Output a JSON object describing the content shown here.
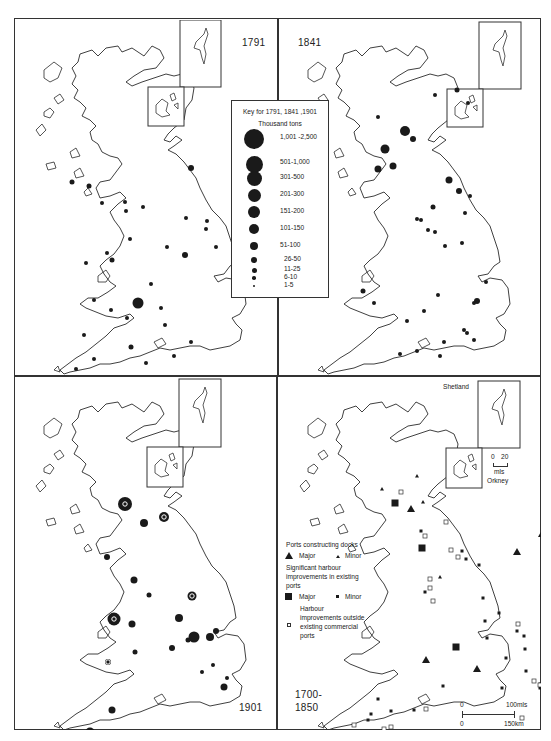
{
  "figure": {
    "panels": [
      {
        "id": "1791",
        "label": "1791",
        "position": "top-left"
      },
      {
        "id": "1841",
        "label": "1841",
        "position": "top-right"
      },
      {
        "id": "1901",
        "label": "1901",
        "position": "bottom-left"
      },
      {
        "id": "1700-1850",
        "label_line1": "1700-",
        "label_line2": "1850",
        "position": "bottom-right"
      }
    ]
  },
  "key": {
    "title": "Key for 1791, 1841 ,1901",
    "subtitle": "Thousand tons",
    "classes": [
      {
        "label": "1,001 -2,500",
        "size": 20
      },
      {
        "label": "501-1,000",
        "size": 17
      },
      {
        "label": "301-500",
        "size": 15
      },
      {
        "label": "201-300",
        "size": 13
      },
      {
        "label": "151-200",
        "size": 12
      },
      {
        "label": "101-150",
        "size": 10
      },
      {
        "label": "51-100",
        "size": 8
      },
      {
        "label": "26-50",
        "size": 6
      },
      {
        "label": "11-25",
        "size": 5
      },
      {
        "label": "6-10",
        "size": 3.5
      },
      {
        "label": "1-5",
        "size": 2.5
      }
    ]
  },
  "legend_1700_1850": {
    "docks_heading": "Ports constructing docks",
    "docks_major": "Major",
    "docks_minor": "Minor",
    "harbour_heading_1": "Significant harbour",
    "harbour_heading_2": "improvements in existing",
    "harbour_heading_3": "ports",
    "harbour_major": "Major",
    "harbour_minor": "Minor",
    "outside_1": "Harbour",
    "outside_2": "improvements outside",
    "outside_3": "existing commercial",
    "outside_4": "ports"
  },
  "insets": {
    "shetland_label": "Shetland",
    "orkney_label": "Orkney",
    "inset_scale_0": "0",
    "inset_scale_20": "20",
    "inset_scale_unit": "mls"
  },
  "scale_bar": {
    "top_zero": "0",
    "top_end": "100mls",
    "bottom_zero": "0",
    "bottom_end": "150km"
  },
  "colors": {
    "ink": "#1a1a1a",
    "frame": "#333333",
    "background": "#ffffff"
  },
  "ports": {
    "1791": [
      [
        124,
        283,
        10
      ],
      [
        177,
        148,
        5
      ],
      [
        112,
        191,
        3
      ],
      [
        116,
        219,
        3
      ],
      [
        137,
        264,
        3
      ],
      [
        147,
        288,
        3
      ],
      [
        151,
        305,
        3
      ],
      [
        117,
        327,
        4
      ],
      [
        132,
        343,
        3
      ],
      [
        80,
        339,
        3
      ],
      [
        62,
        349,
        3
      ],
      [
        111,
        182,
        3
      ],
      [
        93,
        233,
        3
      ],
      [
        98,
        240,
        4
      ],
      [
        72,
        243,
        3
      ],
      [
        58,
        162,
        4
      ],
      [
        88,
        183,
        3
      ],
      [
        75,
        166,
        4
      ],
      [
        129,
        187,
        3
      ],
      [
        153,
        227,
        3
      ],
      [
        171,
        235,
        5
      ],
      [
        172,
        198,
        3
      ],
      [
        192,
        209,
        3
      ],
      [
        193,
        201,
        3
      ],
      [
        202,
        227,
        3
      ],
      [
        70,
        315,
        3
      ],
      [
        177,
        322,
        3
      ],
      [
        160,
        336,
        3
      ],
      [
        80,
        280,
        3
      ],
      [
        97,
        290,
        3
      ],
      [
        113,
        298,
        3
      ]
    ],
    "1841": [
      [
        171,
        160,
        6
      ],
      [
        155,
        187,
        4
      ],
      [
        150,
        210,
        3
      ],
      [
        139,
        199,
        3
      ],
      [
        192,
        176,
        3
      ],
      [
        181,
        171,
        5
      ],
      [
        143,
        200,
        3
      ],
      [
        100,
        97,
        3
      ],
      [
        157,
        75,
        3
      ],
      [
        179,
        70,
        4
      ],
      [
        190,
        83,
        3
      ],
      [
        107,
        129,
        8
      ],
      [
        127,
        111,
        9
      ],
      [
        135,
        119,
        5
      ],
      [
        100,
        149,
        6
      ],
      [
        115,
        146,
        6
      ],
      [
        157,
        212,
        3
      ],
      [
        167,
        226,
        3
      ],
      [
        187,
        193,
        3
      ],
      [
        184,
        223,
        3
      ],
      [
        208,
        262,
        3
      ],
      [
        199,
        281,
        5
      ],
      [
        196,
        283,
        3
      ],
      [
        129,
        301,
        3
      ],
      [
        122,
        334,
        3
      ],
      [
        85,
        271,
        4
      ],
      [
        96,
        283,
        3
      ],
      [
        160,
        275,
        3
      ],
      [
        139,
        331,
        3
      ],
      [
        146,
        291,
        3
      ],
      [
        162,
        336,
        3
      ],
      [
        166,
        322,
        3
      ],
      [
        186,
        310,
        3
      ],
      [
        189,
        313,
        3
      ],
      [
        196,
        320,
        3
      ]
    ],
    "1901": [
      [
        130,
        147,
        7
      ],
      [
        150,
        141,
        9
      ],
      [
        111,
        128,
        13
      ],
      [
        93,
        181,
        5
      ],
      [
        100,
        243,
        12
      ],
      [
        118,
        248,
        6
      ],
      [
        94,
        286,
        5
      ],
      [
        76,
        356,
        8
      ],
      [
        98,
        334,
        6
      ],
      [
        121,
        276,
        4
      ],
      [
        178,
        220,
        8
      ],
      [
        165,
        242,
        7
      ],
      [
        202,
        255,
        5
      ],
      [
        180,
        261,
        10
      ],
      [
        196,
        261,
        7
      ],
      [
        158,
        272,
        5
      ],
      [
        174,
        264,
        4
      ],
      [
        120,
        204,
        6
      ],
      [
        135,
        219,
        4
      ],
      [
        188,
        296,
        3
      ],
      [
        199,
        289,
        3
      ],
      [
        213,
        302,
        3
      ],
      [
        210,
        311,
        6
      ]
    ],
    "1700-1850": []
  },
  "ports_1700_1850": {
    "triangles_major": [
      [
        133,
        133
      ],
      [
        239,
        176
      ],
      [
        268,
        207
      ],
      [
        271,
        212
      ],
      [
        148,
        284
      ],
      [
        199,
        293
      ],
      [
        264,
        158
      ]
    ],
    "triangles_minor": [
      [
        139,
        100
      ],
      [
        145,
        126
      ],
      [
        104,
        113
      ],
      [
        162,
        201
      ]
    ],
    "squares_major": [
      [
        117,
        127
      ],
      [
        144,
        172
      ],
      [
        178,
        271
      ],
      [
        264,
        310
      ]
    ],
    "squares_minor": [
      [
        143,
        155
      ],
      [
        147,
        216
      ],
      [
        184,
        175
      ],
      [
        188,
        183
      ],
      [
        201,
        189
      ],
      [
        205,
        222
      ],
      [
        207,
        245
      ],
      [
        209,
        262
      ],
      [
        239,
        255
      ],
      [
        246,
        260
      ],
      [
        228,
        282
      ],
      [
        221,
        237
      ],
      [
        247,
        273
      ],
      [
        100,
        323
      ],
      [
        113,
        335
      ],
      [
        136,
        334
      ],
      [
        165,
        310
      ],
      [
        248,
        295
      ],
      [
        224,
        312
      ],
      [
        93,
        338
      ],
      [
        90,
        344
      ]
    ],
    "squares_open": [
      [
        123,
        116
      ],
      [
        168,
        146
      ],
      [
        147,
        160
      ],
      [
        173,
        174
      ],
      [
        180,
        181
      ],
      [
        152,
        203
      ],
      [
        152,
        212
      ],
      [
        155,
        225
      ],
      [
        240,
        248
      ],
      [
        256,
        305
      ],
      [
        262,
        309
      ],
      [
        244,
        342
      ],
      [
        76,
        349
      ],
      [
        148,
        333
      ],
      [
        113,
        351
      ],
      [
        106,
        353
      ]
    ]
  }
}
